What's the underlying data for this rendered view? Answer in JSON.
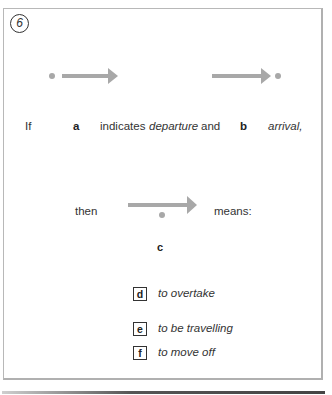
{
  "exercise": {
    "number": "6",
    "arrow_color": "#a8a8a8",
    "sentence": {
      "if": "If",
      "a": "a",
      "indicates": "indicates",
      "departure": "departure",
      "and": "and",
      "b": "b",
      "arrival": "arrival,"
    },
    "then": "then",
    "means": "means:",
    "c": "c",
    "options": [
      {
        "letter": "d",
        "text": "to overtake"
      },
      {
        "letter": "e",
        "text": "to be travelling"
      },
      {
        "letter": "f",
        "text": "to move off"
      }
    ]
  }
}
